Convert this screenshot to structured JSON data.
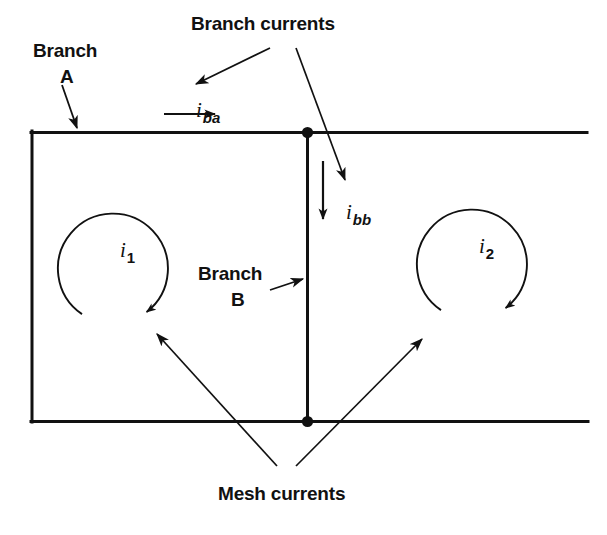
{
  "figure": {
    "background": "#ffffff",
    "ink_color": "#111111",
    "width": 607,
    "height": 535
  },
  "labels": {
    "branch_currents": "Branch currents",
    "branch_a_line1": "Branch",
    "branch_a_line2": "A",
    "branch_b_line1": "Branch",
    "branch_b_line2": "B",
    "mesh_currents": "Mesh currents"
  },
  "currents": {
    "branch_a": {
      "symbol": "i",
      "subscript": "ba",
      "direction": "right"
    },
    "branch_b": {
      "symbol": "i",
      "subscript": "bb",
      "direction": "down"
    },
    "mesh_1": {
      "symbol": "i",
      "subscript": "1",
      "direction": "clockwise"
    },
    "mesh_2": {
      "symbol": "i",
      "subscript": "2",
      "direction": "clockwise"
    }
  },
  "circuit": {
    "top_wire": {
      "x1": 31,
      "y1": 132,
      "x2": 587,
      "y2": 132
    },
    "bottom_wire": {
      "x1": 31,
      "y1": 421,
      "x2": 588,
      "y2": 421
    },
    "left_wire": {
      "x1": 31,
      "y1": 132,
      "x2": 31,
      "y2": 421
    },
    "middle_branch": {
      "x1": 307,
      "y1": 132,
      "x2": 307,
      "y2": 421
    },
    "nodes": [
      {
        "cx": 307,
        "cy": 132,
        "r": 5
      },
      {
        "cx": 307,
        "cy": 421,
        "r": 5
      }
    ]
  },
  "mesh_loops": {
    "loop1": {
      "cx": 113,
      "cy": 268,
      "r": 55,
      "gap_deg": 56
    },
    "loop2": {
      "cx": 472,
      "cy": 264,
      "r": 55,
      "gap_deg": 56
    }
  }
}
